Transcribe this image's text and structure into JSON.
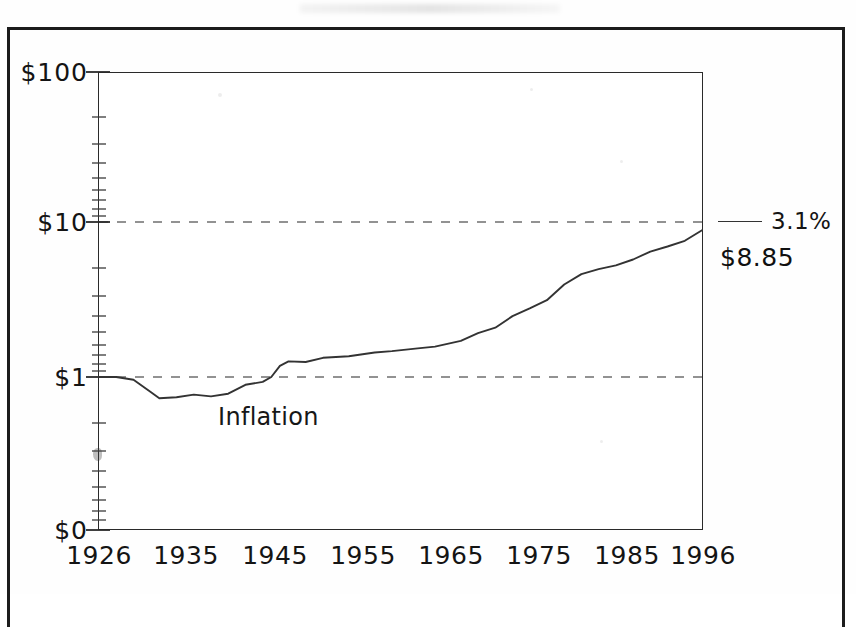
{
  "chart_data": {
    "type": "line",
    "title": "",
    "subtitle": "",
    "xlabel": "",
    "ylabel": "",
    "scale": "log",
    "grid": "dashed-horizontal",
    "legend_position": "right",
    "xlim": [
      1926,
      1996
    ],
    "ylim": [
      0.35,
      100
    ],
    "y_tick_labels": [
      "$100",
      "$10",
      "$1",
      "$0"
    ],
    "y_tick_values": [
      100,
      10,
      1,
      0
    ],
    "x_tick_labels": [
      "1926",
      "1935",
      "1945",
      "1955",
      "1965",
      "1975",
      "1985",
      "1996"
    ],
    "x_tick_values": [
      1926,
      1935,
      1945,
      1955,
      1965,
      1975,
      1985,
      1996
    ],
    "gridlines": [
      10,
      1
    ],
    "annotations": [
      {
        "text": "Inflation",
        "x": 1938,
        "y": 0.62
      }
    ],
    "series": [
      {
        "name": "Inflation",
        "legend_label": "3.1%",
        "end_value_label": "$8.85",
        "color": "#333333",
        "x": [
          1926,
          1928,
          1930,
          1932,
          1933,
          1935,
          1937,
          1939,
          1941,
          1943,
          1945,
          1946,
          1947,
          1948,
          1950,
          1952,
          1955,
          1958,
          1960,
          1963,
          1965,
          1968,
          1970,
          1972,
          1974,
          1976,
          1978,
          1980,
          1982,
          1984,
          1986,
          1988,
          1990,
          1992,
          1994,
          1996
        ],
        "values": [
          1.0,
          1.0,
          0.96,
          0.8,
          0.73,
          0.74,
          0.77,
          0.75,
          0.78,
          0.89,
          0.93,
          1.0,
          1.18,
          1.26,
          1.25,
          1.33,
          1.36,
          1.44,
          1.47,
          1.53,
          1.57,
          1.71,
          1.92,
          2.08,
          2.47,
          2.77,
          3.13,
          3.95,
          4.61,
          4.97,
          5.25,
          5.73,
          6.44,
          6.95,
          7.56,
          8.85
        ]
      }
    ]
  },
  "axes": {
    "y_ticks": [
      {
        "label": "$100"
      },
      {
        "label": "$10"
      },
      {
        "label": "$1"
      },
      {
        "label": "$0"
      }
    ],
    "x_ticks": [
      {
        "label": "1926"
      },
      {
        "label": "1935"
      },
      {
        "label": "1945"
      },
      {
        "label": "1955"
      },
      {
        "label": "1965"
      },
      {
        "label": "1975"
      },
      {
        "label": "1985"
      },
      {
        "label": "1996"
      }
    ]
  },
  "legend": {
    "rate_label": "3.1%",
    "value_label": "$8.85"
  },
  "annotation": {
    "inflation_label": "Inflation"
  },
  "colors": {
    "line": "#333333",
    "axis": "#2a2a2a",
    "grid": "#808080",
    "text": "#141414",
    "frame": "#1c1c1c"
  }
}
